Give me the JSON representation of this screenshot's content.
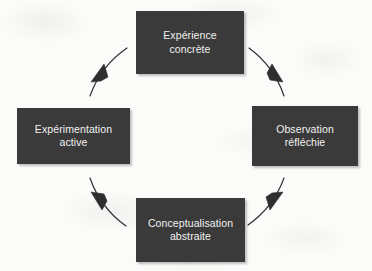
{
  "diagram": {
    "direction": "clockwise",
    "colors": {
      "node_fill": "#3a3a3a",
      "node_text": "#f2f2f2",
      "arrow": "#2e2e2e",
      "background": "#fbfbfa"
    },
    "nodes": [
      {
        "id": "concrete",
        "label": "Expérience\nconcrète",
        "position": "top"
      },
      {
        "id": "reflective",
        "label": "Observation\nréfléchie",
        "position": "right"
      },
      {
        "id": "abstract",
        "label": "Conceptualisation\nabstraite",
        "position": "bottom"
      },
      {
        "id": "active",
        "label": "Expérimentation\nactive",
        "position": "left"
      }
    ],
    "arrows": [
      {
        "id": "arrow-concrete-to-reflective",
        "from": "concrete",
        "to": "reflective",
        "quadrant": "top-right"
      },
      {
        "id": "arrow-reflective-to-abstract",
        "from": "reflective",
        "to": "abstract",
        "quadrant": "bottom-right"
      },
      {
        "id": "arrow-abstract-to-active",
        "from": "abstract",
        "to": "active",
        "quadrant": "bottom-left"
      },
      {
        "id": "arrow-active-to-concrete",
        "from": "active",
        "to": "concrete",
        "quadrant": "top-left"
      }
    ]
  }
}
